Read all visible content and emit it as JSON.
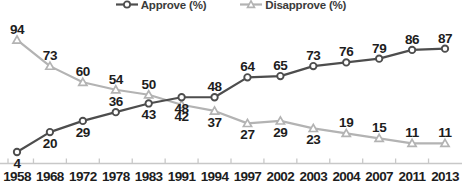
{
  "legend": {
    "items": [
      {
        "label": "Approve (%)",
        "marker": "circle-marker-icon",
        "color": "#4d4d4d"
      },
      {
        "label": "Disapprove (%)",
        "marker": "triangle-marker-icon",
        "color": "#b3b3b3"
      }
    ]
  },
  "colors": {
    "approve_line": "#4d4d4d",
    "disapprove_line": "#b3b3b3",
    "marker_fill": "#ffffff",
    "axis": "#c8c8c8",
    "label_text": "#1d1d1d",
    "background": "#ffffff"
  },
  "chart_data": {
    "type": "line",
    "title": "",
    "subtitle": "",
    "xlabel": "",
    "ylabel": "",
    "ylim": [
      0,
      100
    ],
    "grid": false,
    "legend_position": "top-center",
    "categories": [
      "1958",
      "1968",
      "1972",
      "1978",
      "1983",
      "1991",
      "1994",
      "1997",
      "2002",
      "2003",
      "2004",
      "2007",
      "2011",
      "2013"
    ],
    "series": [
      {
        "name": "Approve (%)",
        "color": "#4d4d4d",
        "marker": "circle",
        "values": [
          4,
          20,
          29,
          36,
          43,
          48,
          48,
          64,
          65,
          73,
          76,
          79,
          86,
          87
        ],
        "label_positions": [
          "below",
          "below",
          "below",
          "above",
          "below",
          "below",
          "above",
          "above",
          "above",
          "above",
          "above",
          "above",
          "above",
          "above"
        ]
      },
      {
        "name": "Disapprove (%)",
        "color": "#b3b3b3",
        "marker": "triangle",
        "values": [
          94,
          73,
          60,
          54,
          50,
          42,
          37,
          27,
          29,
          23,
          19,
          15,
          11,
          11
        ],
        "label_positions": [
          "above",
          "above",
          "above",
          "above",
          "above",
          "below",
          "below",
          "below",
          "below",
          "below",
          "above",
          "above",
          "above",
          "above"
        ]
      }
    ]
  }
}
